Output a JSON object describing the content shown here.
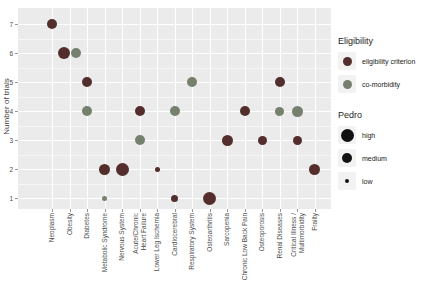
{
  "figure": {
    "y_axis_title": "Number of trials"
  },
  "panel": {
    "bg": "#ebebeb",
    "grid": "#ffffff"
  },
  "legend": {
    "eligibility": {
      "title": "Eligibility",
      "items": [
        {
          "label": "eligibility criterion",
          "color": "#532e2c"
        },
        {
          "label": "co-morbidity",
          "color": "#75806e"
        }
      ]
    },
    "pedro": {
      "title": "Pedro",
      "color": "#121212",
      "items": [
        {
          "label": "high",
          "size_px": 13
        },
        {
          "label": "medium",
          "size_px": 10
        },
        {
          "label": "low",
          "size_px": 4.5
        }
      ]
    }
  },
  "chart_data": {
    "type": "scatter",
    "title": "",
    "xlabel": "",
    "ylabel": "Number of trials",
    "ylim": [
      1,
      7
    ],
    "y_ticks": [
      1,
      2,
      3,
      4,
      5,
      6,
      7
    ],
    "grid": "on",
    "legend_position": "right",
    "categories": [
      "Neoplasm",
      "Obesity",
      "Diabetes",
      "Metabolic Syndrome",
      "Nervous System",
      "Acute/Chronic\nHeart Failure",
      "Lower Leg Ischemia",
      "Cardiocerebral",
      "Respiratory System",
      "Osteoarthritis",
      "Sarcopenia",
      "Chronic Low Back Pain",
      "Osteoporosis",
      "Renal Diseases",
      "Critical Illness /\nMultimorbidity",
      "Frailty"
    ],
    "series": [
      {
        "name": "eligibility criterion",
        "color": "#532e2c",
        "points": [
          {
            "category": "Neoplasm",
            "trials": 7,
            "pedro": "medium",
            "size_px": 10
          },
          {
            "category": "Obesity",
            "trials": 6,
            "pedro": "high",
            "size_px": 12
          },
          {
            "category": "Diabetes",
            "trials": 5,
            "pedro": "medium",
            "size_px": 10
          },
          {
            "category": "Metabolic Syndrome",
            "trials": 2,
            "pedro": "medium",
            "size_px": 11
          },
          {
            "category": "Nervous System",
            "trials": 2,
            "pedro": "high",
            "size_px": 13
          },
          {
            "category": "Acute/Chronic\nHeart Failure",
            "trials": 4,
            "pedro": "medium",
            "size_px": 10
          },
          {
            "category": "Lower Leg Ischemia",
            "trials": 2,
            "pedro": "low",
            "size_px": 5
          },
          {
            "category": "Cardiocerebral",
            "trials": 1,
            "pedro": "medium",
            "size_px": 7
          },
          {
            "category": "Osteoarthritis",
            "trials": 1,
            "pedro": "high",
            "size_px": 13
          },
          {
            "category": "Sarcopenia",
            "trials": 3,
            "pedro": "medium",
            "size_px": 11
          },
          {
            "category": "Chronic Low Back Pain",
            "trials": 4,
            "pedro": "medium",
            "size_px": 10
          },
          {
            "category": "Osteoporosis",
            "trials": 3,
            "pedro": "medium",
            "size_px": 9
          },
          {
            "category": "Renal Diseases",
            "trials": 5,
            "pedro": "medium",
            "size_px": 10
          },
          {
            "category": "Critical Illness /\nMultimorbidity",
            "trials": 3,
            "pedro": "medium",
            "size_px": 9
          },
          {
            "category": "Frailty",
            "trials": 2,
            "pedro": "medium",
            "size_px": 11
          }
        ]
      },
      {
        "name": "co-morbidity",
        "color": "#75806e",
        "points": [
          {
            "category": "Obesity",
            "trials": 6,
            "pedro": "medium",
            "size_px": 10
          },
          {
            "category": "Diabetes",
            "trials": 4,
            "pedro": "medium",
            "size_px": 10
          },
          {
            "category": "Metabolic Syndrome",
            "trials": 1,
            "pedro": "low",
            "size_px": 5
          },
          {
            "category": "Acute/Chronic\nHeart Failure",
            "trials": 3,
            "pedro": "medium",
            "size_px": 10
          },
          {
            "category": "Cardiocerebral",
            "trials": 4,
            "pedro": "medium",
            "size_px": 10
          },
          {
            "category": "Respiratory System",
            "trials": 5,
            "pedro": "medium",
            "size_px": 10
          },
          {
            "category": "Renal Diseases",
            "trials": 4,
            "pedro": "medium",
            "size_px": 9
          },
          {
            "category": "Critical Illness /\nMultimorbidity",
            "trials": 4,
            "pedro": "medium",
            "size_px": 11
          }
        ]
      }
    ]
  }
}
